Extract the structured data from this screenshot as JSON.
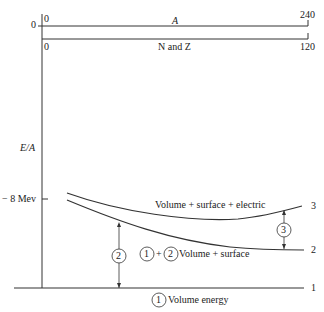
{
  "axes": {
    "top_axis": {
      "label": "A",
      "min": "0",
      "max": "240"
    },
    "second_axis": {
      "label": "N and Z",
      "min": "0",
      "max": "120"
    },
    "y_axis": {
      "label": "E/A",
      "zero_tick": "0",
      "tick_label": "− 8 Mev"
    }
  },
  "curves": {
    "curve_3": {
      "label": "Volume + surface + electric",
      "end_number": "3"
    },
    "curve_2": {
      "label": "Volume + surface",
      "end_number": "2",
      "prefix_a": "1",
      "plus": "+",
      "prefix_b": "2"
    },
    "curve_1": {
      "label": "Volume energy",
      "end_number": "1",
      "prefix": "1"
    }
  },
  "markers": {
    "surface_gap": "2",
    "electric_gap": "3"
  }
}
